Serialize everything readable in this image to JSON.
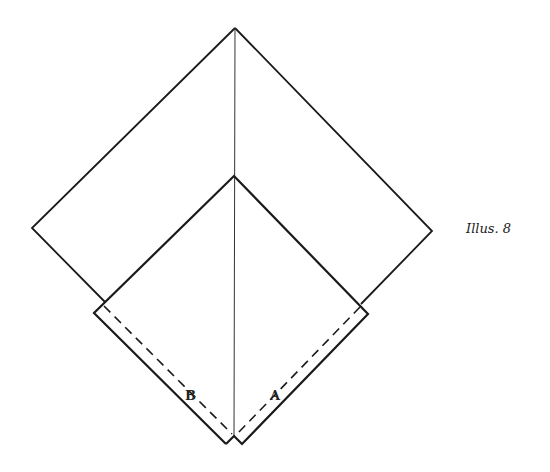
{
  "caption": "Illus. 8",
  "labels": {
    "a": "A",
    "b": "B"
  },
  "colors": {
    "line": "#1a1a1a",
    "background": "#ffffff"
  },
  "shapes": {
    "outer_square": {
      "top": [
        235,
        28
      ],
      "left": [
        32,
        228
      ],
      "right": [
        432,
        231
      ]
    },
    "inner_square": {
      "top": [
        234,
        176
      ],
      "left": [
        94,
        313
      ],
      "right": [
        368,
        314
      ],
      "bottom_left": [
        226,
        444
      ],
      "bottom_right": [
        242,
        444
      ],
      "notch": [
        234,
        436
      ]
    },
    "center_line": {
      "from": [
        235,
        28
      ],
      "to": [
        234,
        436
      ]
    },
    "dashed_fold_lines": [
      "B",
      "A"
    ]
  }
}
